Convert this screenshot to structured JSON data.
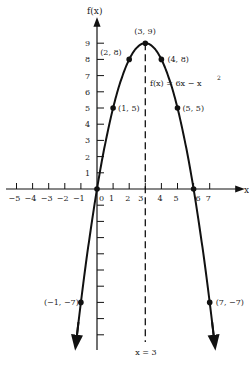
{
  "chart_data": {
    "type": "line",
    "title": "",
    "function_label": "f(x) = 6x − x²",
    "xlabel": "x",
    "ylabel": "f(x)",
    "xlim": [
      -5.5,
      8.5
    ],
    "ylim": [
      -11,
      10.5
    ],
    "x_ticks": [
      -5,
      -4,
      -3,
      -2,
      -1,
      0,
      1,
      2,
      3,
      4,
      5,
      6,
      7
    ],
    "x_tick_labels": [
      "−5",
      "−4",
      "−3",
      "−2",
      "−1",
      "0",
      "1",
      "2",
      "3",
      "4",
      "5",
      "6",
      "7"
    ],
    "y_ticks": [
      1,
      2,
      3,
      4,
      5,
      6,
      7,
      8,
      9
    ],
    "y_tick_labels": [
      "1",
      "2",
      "3",
      "4",
      "5",
      "6",
      "7",
      "8",
      "9"
    ],
    "axis_of_symmetry": {
      "x": 3,
      "label": "x = 3"
    },
    "vertex": {
      "x": 3,
      "y": 9,
      "label": "(3, 9)"
    },
    "points": [
      {
        "x": -1,
        "y": -7,
        "label": "(−1, −7)"
      },
      {
        "x": 0,
        "y": 0,
        "label": ""
      },
      {
        "x": 1,
        "y": 5,
        "label": "(1, 5)"
      },
      {
        "x": 2,
        "y": 8,
        "label": "(2, 8)"
      },
      {
        "x": 3,
        "y": 9,
        "label": "(3, 9)"
      },
      {
        "x": 4,
        "y": 8,
        "label": "(4, 8)"
      },
      {
        "x": 5,
        "y": 5,
        "label": "(5, 5)"
      },
      {
        "x": 6,
        "y": 0,
        "label": ""
      },
      {
        "x": 7,
        "y": -7,
        "label": "(7, −7)"
      }
    ],
    "series": [
      {
        "name": "f(x) = 6x − x²",
        "expression": "6x - x^2",
        "x_range": [
          -1.3,
          7.3
        ],
        "color": "#111111"
      }
    ],
    "grid": false,
    "legend": "none"
  }
}
